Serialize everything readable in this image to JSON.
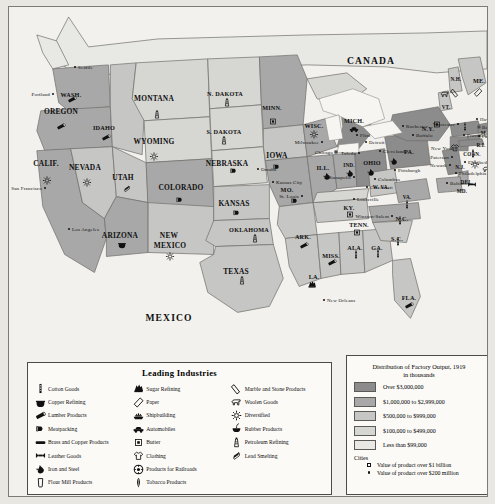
{
  "map": {
    "title": "Leading Industries of the United States, 1919",
    "countries": [
      {
        "name": "CANADA",
        "x": 362,
        "y": 53
      },
      {
        "name": "MEXICO",
        "x": 160,
        "y": 310
      }
    ],
    "states": [
      {
        "name": "WASH.",
        "x": 62,
        "y": 87,
        "size": "sm"
      },
      {
        "name": "OREGON",
        "x": 52,
        "y": 104,
        "size": ""
      },
      {
        "name": "IDAHO",
        "x": 95,
        "y": 120,
        "size": "sm"
      },
      {
        "name": "MONTANA",
        "x": 145,
        "y": 91,
        "size": ""
      },
      {
        "name": "N. DAKOTA",
        "x": 216,
        "y": 86,
        "size": "sm"
      },
      {
        "name": "S. DAKOTA",
        "x": 215,
        "y": 124,
        "size": "sm"
      },
      {
        "name": "MINN.",
        "x": 263,
        "y": 100,
        "size": "sm"
      },
      {
        "name": "WISC.",
        "x": 305,
        "y": 118,
        "size": "sm"
      },
      {
        "name": "MICH.",
        "x": 345,
        "y": 113,
        "size": "sm"
      },
      {
        "name": "WYOMING",
        "x": 145,
        "y": 134,
        "size": ""
      },
      {
        "name": "NEVADA",
        "x": 76,
        "y": 160,
        "size": ""
      },
      {
        "name": "CALIF.",
        "x": 37,
        "y": 156,
        "size": ""
      },
      {
        "name": "UTAH",
        "x": 114,
        "y": 170,
        "size": ""
      },
      {
        "name": "COLORADO",
        "x": 172,
        "y": 180,
        "size": ""
      },
      {
        "name": "NEBRASKA",
        "x": 218,
        "y": 156,
        "size": ""
      },
      {
        "name": "IOWA",
        "x": 268,
        "y": 148,
        "size": ""
      },
      {
        "name": "ILL.",
        "x": 314,
        "y": 160,
        "size": "sm"
      },
      {
        "name": "IND.",
        "x": 340,
        "y": 158,
        "size": "xs"
      },
      {
        "name": "OHIO",
        "x": 363,
        "y": 155,
        "size": "sm"
      },
      {
        "name": "KANSAS",
        "x": 225,
        "y": 196,
        "size": ""
      },
      {
        "name": "MO.",
        "x": 278,
        "y": 182,
        "size": "sm"
      },
      {
        "name": "KY.",
        "x": 340,
        "y": 200,
        "size": "sm"
      },
      {
        "name": "TENN.",
        "x": 350,
        "y": 217,
        "size": "sm"
      },
      {
        "name": "N.C.",
        "x": 393,
        "y": 211,
        "size": "sm"
      },
      {
        "name": "S.C.",
        "x": 388,
        "y": 231,
        "size": "sm"
      },
      {
        "name": "GA.",
        "x": 368,
        "y": 240,
        "size": "sm"
      },
      {
        "name": "ALA.",
        "x": 346,
        "y": 240,
        "size": "sm"
      },
      {
        "name": "MISS.",
        "x": 322,
        "y": 248,
        "size": "sm"
      },
      {
        "name": "ARK.",
        "x": 294,
        "y": 229,
        "size": "sm"
      },
      {
        "name": "LA.",
        "x": 305,
        "y": 269,
        "size": "sm"
      },
      {
        "name": "OKLAHOMA",
        "x": 240,
        "y": 222,
        "size": "sm"
      },
      {
        "name": "TEXAS",
        "x": 227,
        "y": 264,
        "size": ""
      },
      {
        "name": "NEW",
        "x": 160,
        "y": 228,
        "size": ""
      },
      {
        "name": "MEXICO",
        "x": 161,
        "y": 238,
        "size": ""
      },
      {
        "name": "ARIZONA",
        "x": 111,
        "y": 228,
        "size": ""
      },
      {
        "name": "FLA.",
        "x": 400,
        "y": 290,
        "size": "sm"
      },
      {
        "name": "VA.",
        "x": 398,
        "y": 190,
        "size": "xs"
      },
      {
        "name": "W. VA.",
        "x": 372,
        "y": 180,
        "size": "xs"
      },
      {
        "name": "PA.",
        "x": 400,
        "y": 144,
        "size": "sm"
      },
      {
        "name": "N.Y.",
        "x": 419,
        "y": 121,
        "size": "sm"
      },
      {
        "name": "VT.",
        "x": 437,
        "y": 100,
        "size": "xs"
      },
      {
        "name": "N.H.",
        "x": 447,
        "y": 72,
        "size": "xs"
      },
      {
        "name": "ME.",
        "x": 470,
        "y": 73,
        "size": "sm"
      },
      {
        "name": "MA.",
        "x": 477,
        "y": 126,
        "size": "xs"
      },
      {
        "name": "R.I.",
        "x": 472,
        "y": 138,
        "size": "xs"
      },
      {
        "name": "CONN.",
        "x": 463,
        "y": 147,
        "size": "xs"
      },
      {
        "name": "N.J.",
        "x": 451,
        "y": 160,
        "size": "xs"
      },
      {
        "name": "DEL.",
        "x": 458,
        "y": 175,
        "size": "xs"
      },
      {
        "name": "MD.",
        "x": 453,
        "y": 184,
        "size": "xs"
      }
    ],
    "cities": [
      {
        "name": "Seattle",
        "x": 66,
        "y": 60,
        "type": "dot",
        "anchor": "left"
      },
      {
        "name": "Portland",
        "x": 44,
        "y": 87,
        "type": "dot",
        "anchor": "right"
      },
      {
        "name": "San Francisco",
        "x": 36,
        "y": 181,
        "type": "dot",
        "anchor": "right"
      },
      {
        "name": "Los Angeles",
        "x": 60,
        "y": 222,
        "type": "dot",
        "anchor": "left"
      },
      {
        "name": "Omaha",
        "x": 249,
        "y": 162,
        "type": "dot",
        "anchor": "left"
      },
      {
        "name": "Milwaukee",
        "x": 313,
        "y": 135,
        "type": "dot",
        "anchor": "right"
      },
      {
        "name": "Chicago",
        "x": 327,
        "y": 145,
        "type": "sq",
        "anchor": "right"
      },
      {
        "name": "Kansas City",
        "x": 264,
        "y": 175,
        "type": "dot",
        "anchor": "left"
      },
      {
        "name": "St. Louis",
        "x": 293,
        "y": 189,
        "type": "dot",
        "anchor": "right"
      },
      {
        "name": "Indianapolis",
        "x": 345,
        "y": 170,
        "type": "dot",
        "anchor": "right"
      },
      {
        "name": "Cincinnati",
        "x": 358,
        "y": 180,
        "type": "dot",
        "anchor": "left"
      },
      {
        "name": "Columbus",
        "x": 366,
        "y": 172,
        "type": "dot",
        "anchor": "left"
      },
      {
        "name": "Toledo",
        "x": 350,
        "y": 146,
        "type": "dot",
        "anchor": "right"
      },
      {
        "name": "Cleveland",
        "x": 371,
        "y": 144,
        "type": "dot",
        "anchor": "left"
      },
      {
        "name": "Detroit",
        "x": 357,
        "y": 135,
        "type": "dot",
        "anchor": "left"
      },
      {
        "name": "Flint",
        "x": 348,
        "y": 128,
        "type": "dot",
        "anchor": "left"
      },
      {
        "name": "Louisville",
        "x": 345,
        "y": 192,
        "type": "dot",
        "anchor": "left"
      },
      {
        "name": "Pittsburgh",
        "x": 386,
        "y": 163,
        "type": "dot",
        "anchor": "left"
      },
      {
        "name": "Buffalo",
        "x": 404,
        "y": 128,
        "type": "dot",
        "anchor": "left"
      },
      {
        "name": "Rochester",
        "x": 394,
        "y": 119,
        "type": "dot",
        "anchor": "left"
      },
      {
        "name": "Winston-Salem",
        "x": 383,
        "y": 209,
        "type": "dot",
        "anchor": "right"
      },
      {
        "name": "New Orleans",
        "x": 315,
        "y": 293,
        "type": "dot",
        "anchor": "left"
      },
      {
        "name": "Worcester",
        "x": 449,
        "y": 117,
        "type": "dot",
        "anchor": "right"
      },
      {
        "name": "Haverhill",
        "x": 468,
        "y": 112,
        "type": "dot",
        "anchor": "left"
      },
      {
        "name": "Boston",
        "x": 470,
        "y": 120,
        "type": "sq",
        "anchor": "left"
      },
      {
        "name": "Fall River",
        "x": 470,
        "y": 129,
        "type": "dot",
        "anchor": "left"
      },
      {
        "name": "Providence",
        "x": 455,
        "y": 128,
        "type": "dot",
        "anchor": "left"
      },
      {
        "name": "New York",
        "x": 447,
        "y": 141,
        "type": "sq",
        "anchor": "right"
      },
      {
        "name": "Paterson",
        "x": 443,
        "y": 150,
        "type": "dot",
        "anchor": "right"
      },
      {
        "name": "Newark",
        "x": 441,
        "y": 158,
        "type": "dot",
        "anchor": "right"
      },
      {
        "name": "Elizabeth",
        "x": 456,
        "y": 155,
        "type": "dot",
        "anchor": "left"
      },
      {
        "name": "Philadelphia",
        "x": 447,
        "y": 166,
        "type": "dot",
        "anchor": "left"
      },
      {
        "name": "Baltimore",
        "x": 438,
        "y": 176,
        "type": "dot",
        "anchor": "left"
      }
    ],
    "industry_markers": [
      {
        "icon": "lumber",
        "x": 63,
        "y": 93
      },
      {
        "icon": "lumber",
        "x": 52,
        "y": 120
      },
      {
        "icon": "lumber",
        "x": 97,
        "y": 131
      },
      {
        "icon": "petroleum",
        "x": 148,
        "y": 108
      },
      {
        "icon": "diversified",
        "x": 78,
        "y": 176
      },
      {
        "icon": "diversified",
        "x": 38,
        "y": 174
      },
      {
        "icon": "leadsmelt",
        "x": 118,
        "y": 182
      },
      {
        "icon": "copperrefine",
        "x": 113,
        "y": 238
      },
      {
        "icon": "diversified",
        "x": 161,
        "y": 250
      },
      {
        "icon": "meatpack",
        "x": 171,
        "y": 193
      },
      {
        "icon": "diversified",
        "x": 145,
        "y": 150
      },
      {
        "icon": "petroleum",
        "x": 218,
        "y": 96
      },
      {
        "icon": "petroleum",
        "x": 215,
        "y": 134
      },
      {
        "icon": "butter",
        "x": 264,
        "y": 115
      },
      {
        "icon": "meatpack",
        "x": 268,
        "y": 160
      },
      {
        "icon": "meatpack",
        "x": 225,
        "y": 164
      },
      {
        "icon": "meatpack",
        "x": 228,
        "y": 206
      },
      {
        "icon": "meatpack",
        "x": 286,
        "y": 194
      },
      {
        "icon": "diversified",
        "x": 305,
        "y": 128
      },
      {
        "icon": "automobile",
        "x": 345,
        "y": 122
      },
      {
        "icon": "ironsteel",
        "x": 318,
        "y": 170
      },
      {
        "icon": "ironsteel",
        "x": 341,
        "y": 167
      },
      {
        "icon": "ironsteel",
        "x": 362,
        "y": 166
      },
      {
        "icon": "ironsteel",
        "x": 385,
        "y": 155
      },
      {
        "icon": "petroleum",
        "x": 246,
        "y": 232
      },
      {
        "icon": "petroleum",
        "x": 233,
        "y": 274
      },
      {
        "icon": "lumber",
        "x": 295,
        "y": 239
      },
      {
        "icon": "lumber",
        "x": 323,
        "y": 256
      },
      {
        "icon": "sugar",
        "x": 303,
        "y": 278
      },
      {
        "icon": "lumber",
        "x": 400,
        "y": 299
      },
      {
        "icon": "butter",
        "x": 341,
        "y": 208
      },
      {
        "icon": "butter",
        "x": 348,
        "y": 226
      },
      {
        "icon": "cotton",
        "x": 391,
        "y": 214
      },
      {
        "icon": "cotton",
        "x": 389,
        "y": 235
      },
      {
        "icon": "cotton",
        "x": 369,
        "y": 247
      },
      {
        "icon": "cotton",
        "x": 347,
        "y": 248
      },
      {
        "icon": "cotton",
        "x": 398,
        "y": 198
      },
      {
        "icon": "woolen",
        "x": 436,
        "y": 88
      },
      {
        "icon": "marble",
        "x": 446,
        "y": 86
      },
      {
        "icon": "paper",
        "x": 469,
        "y": 86
      },
      {
        "icon": "cotton",
        "x": 456,
        "y": 120
      },
      {
        "icon": "clothing",
        "x": 446,
        "y": 141
      },
      {
        "icon": "diversified",
        "x": 466,
        "y": 158
      },
      {
        "icon": "cotton",
        "x": 464,
        "y": 147
      },
      {
        "icon": "woolen",
        "x": 478,
        "y": 163
      },
      {
        "icon": "leather",
        "x": 463,
        "y": 178
      },
      {
        "icon": "butter",
        "x": 428,
        "y": 118
      }
    ]
  },
  "industry_legend": {
    "title": "Leading Industries",
    "columns": [
      [
        {
          "icon": "cotton",
          "label": "Cotton Goods"
        },
        {
          "icon": "copperrefine",
          "label": "Copper Refining"
        },
        {
          "icon": "lumber",
          "label": "Lumber Products"
        },
        {
          "icon": "meatpack",
          "label": "Meatpacking"
        },
        {
          "icon": "brass",
          "label": "Brass and Copper Products"
        },
        {
          "icon": "leather",
          "label": "Leather Goods"
        },
        {
          "icon": "ironsteel",
          "label": "Iron and Steel"
        },
        {
          "icon": "flour",
          "label": "Flour Mill Products"
        }
      ],
      [
        {
          "icon": "sugar",
          "label": "Sugar Refining"
        },
        {
          "icon": "paper",
          "label": "Paper"
        },
        {
          "icon": "shipbuilding",
          "label": "Shipbuilding"
        },
        {
          "icon": "automobile",
          "label": "Automobiles"
        },
        {
          "icon": "butter",
          "label": "Butter"
        },
        {
          "icon": "clothing",
          "label": "Clothing"
        },
        {
          "icon": "railroad",
          "label": "Products for Railroads"
        },
        {
          "icon": "tobacco",
          "label": "Tobacco Products"
        }
      ],
      [
        {
          "icon": "marble",
          "label": "Marble and Stone Products"
        },
        {
          "icon": "woolen",
          "label": "Woolen Goods"
        },
        {
          "icon": "diversified",
          "label": "Diversified"
        },
        {
          "icon": "rubber",
          "label": "Rubber Products"
        },
        {
          "icon": "petroleum",
          "label": "Petroleum Refining"
        },
        {
          "icon": "leadsmelt",
          "label": "Lead Smelting"
        }
      ]
    ]
  },
  "output_legend": {
    "title_line1": "Distribution of Factory Output, 1919",
    "title_line2": "in thousands",
    "ranges": [
      {
        "label": "Over $3,000,000",
        "color": "#8c8c8c"
      },
      {
        "label": "$1,000,000 to $2,999,000",
        "color": "#a8a8a8"
      },
      {
        "label": "$500,000 to $999,000",
        "color": "#c6c6c4"
      },
      {
        "label": "$100,000 to $499,000",
        "color": "#d6d6d3"
      },
      {
        "label": "Less than $99,000",
        "color": "#e8e8e5"
      }
    ],
    "cities_heading": "Cities",
    "city_keys": [
      {
        "symbol": "square",
        "label": "Value of product over $1 billion"
      },
      {
        "symbol": "dot",
        "label": "Value of product over $200 million"
      }
    ]
  }
}
